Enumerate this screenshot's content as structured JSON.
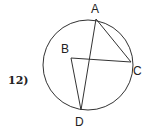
{
  "problem": {
    "number": "12)"
  },
  "diagram": {
    "circle": {
      "cx": 88,
      "cy": 65,
      "r": 45
    },
    "points": [
      {
        "name": "A",
        "x": 96,
        "y": 19,
        "label_x": 91,
        "label_y": 13
      },
      {
        "name": "B",
        "x": 71,
        "y": 58,
        "label_x": 61,
        "label_y": 53
      },
      {
        "name": "C",
        "x": 131,
        "y": 62,
        "label_x": 133,
        "label_y": 75
      },
      {
        "name": "D",
        "x": 81,
        "y": 110,
        "label_x": 75,
        "label_y": 126
      }
    ],
    "segments": [
      [
        "A",
        "C"
      ],
      [
        "A",
        "D"
      ],
      [
        "B",
        "C"
      ],
      [
        "B",
        "D"
      ]
    ],
    "stroke_color": "#333333"
  }
}
